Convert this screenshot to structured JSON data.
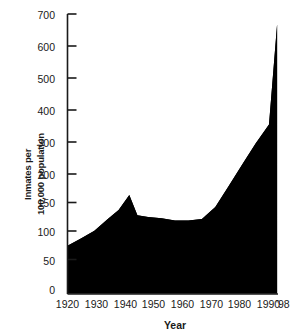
{
  "chart_data": {
    "type": "area",
    "title": "",
    "xlabel": "Year",
    "ylabel": "Inmates per 100,000 population",
    "ylabel_line1": "Inmates per",
    "ylabel_line2": "100,000 population",
    "x": [
      1920,
      1925,
      1930,
      1935,
      1939,
      1943,
      1946,
      1950,
      1955,
      1960,
      1965,
      1970,
      1975,
      1980,
      1985,
      1990,
      1995,
      1998
    ],
    "values": [
      80,
      92,
      105,
      125,
      140,
      165,
      131,
      128,
      126,
      122,
      122,
      125,
      145,
      180,
      230,
      295,
      355,
      668
    ],
    "series": [
      {
        "name": "Inmates per 100,000 population",
        "values": [
          80,
          92,
          105,
          125,
          140,
          165,
          131,
          128,
          126,
          122,
          122,
          125,
          145,
          180,
          230,
          295,
          355,
          668
        ]
      }
    ],
    "xlim": [
      1920,
      1998
    ],
    "ylim": [
      0,
      700
    ],
    "grid": false,
    "legend": "none",
    "fill_color": "#000000",
    "background_color": "#ffffff",
    "y_axis_note": "non-linear: 0-200 at 50-unit steps, 200-700 at 100-unit steps",
    "ytick_labels": [
      "0",
      "50",
      "100",
      "150",
      "200",
      "300",
      "400",
      "500",
      "600",
      "700"
    ],
    "ytick_values": [
      0,
      50,
      100,
      150,
      200,
      300,
      400,
      500,
      600,
      700
    ],
    "xtick_labels": [
      "1920",
      "1930",
      "1940",
      "1950",
      "1960",
      "1970",
      "1980",
      "1990",
      "'98"
    ],
    "xtick_values": [
      1920,
      1930,
      1940,
      1950,
      1960,
      1970,
      1980,
      1990,
      1998
    ]
  }
}
